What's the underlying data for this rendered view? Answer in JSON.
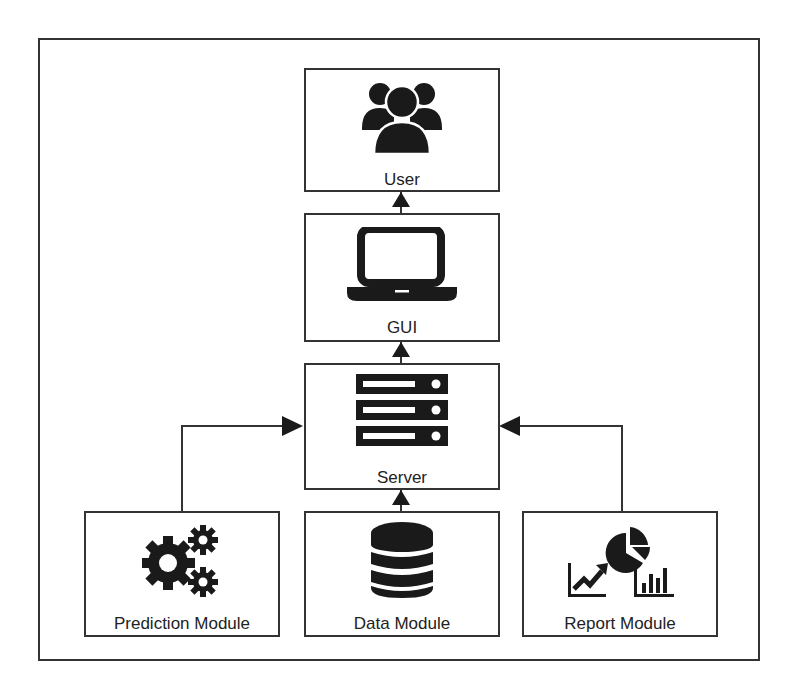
{
  "diagram": {
    "type": "architecture",
    "nodes": [
      {
        "id": "user",
        "label": "User",
        "icon": "users-group-icon"
      },
      {
        "id": "gui",
        "label": "GUI",
        "icon": "laptop-icon"
      },
      {
        "id": "server",
        "label": "Server",
        "icon": "server-rack-icon"
      },
      {
        "id": "prediction",
        "label": "Prediction Module",
        "icon": "gears-icon"
      },
      {
        "id": "data",
        "label": "Data Module",
        "icon": "database-icon"
      },
      {
        "id": "report",
        "label": "Report Module",
        "icon": "charts-report-icon"
      }
    ],
    "edges": [
      {
        "from": "gui",
        "to": "user"
      },
      {
        "from": "server",
        "to": "gui"
      },
      {
        "from": "data",
        "to": "server"
      },
      {
        "from": "prediction",
        "to": "server"
      },
      {
        "from": "report",
        "to": "server"
      }
    ]
  },
  "colors": {
    "stroke": "#333333",
    "icon": "#1a1a1a",
    "background": "#ffffff"
  }
}
